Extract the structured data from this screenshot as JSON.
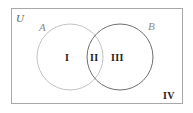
{
  "figure": {
    "name": "two-set-venn-diagram",
    "background_color": "#ffffff"
  },
  "universe": {
    "label": "U",
    "border_color": "#a8a8a8",
    "rect": {
      "x": 11,
      "y": 8,
      "width": 172,
      "height": 96
    }
  },
  "sets": [
    {
      "id": "A",
      "label": "A",
      "stroke_color": "#c0c0c0",
      "center_x": 70,
      "center_y": 57,
      "radius": 33
    },
    {
      "id": "B",
      "label": "B",
      "stroke_color": "#6e6e6e",
      "center_x": 120,
      "center_y": 57,
      "radius": 33
    }
  ],
  "regions": [
    {
      "id": "I",
      "label": "I",
      "meaning": "A only"
    },
    {
      "id": "II",
      "label": "II",
      "meaning": "A and B"
    },
    {
      "id": "III",
      "label": "III",
      "meaning": "B only"
    },
    {
      "id": "IV",
      "label": "IV",
      "meaning": "outside A and B"
    }
  ],
  "text_color": "#1c1c1c"
}
